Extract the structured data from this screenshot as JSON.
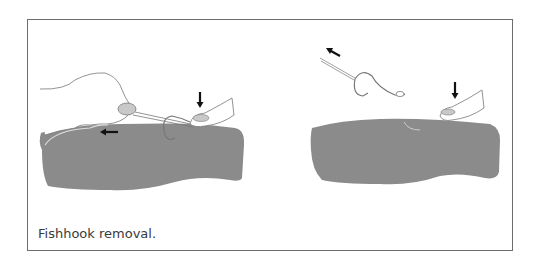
{
  "figure": {
    "caption": "Fishhook removal.",
    "panels": [
      {
        "id": "left",
        "description": "Hand pulling string loop around hook shaft while finger presses down on hook eye",
        "arrows": [
          "left-arrow",
          "down-arrow"
        ]
      },
      {
        "id": "right",
        "description": "Hook pulled out backwards while finger presses down on skin",
        "arrows": [
          "up-left-arrow",
          "down-arrow"
        ]
      }
    ],
    "colors": {
      "skin": "#8b8b8b",
      "frame": "#6d6d6d",
      "line": "#777777",
      "arrow": "#111111",
      "nail": "#c8c8c8"
    }
  }
}
